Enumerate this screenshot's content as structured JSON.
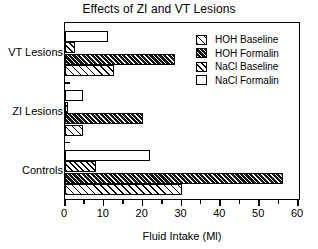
{
  "chart_data": {
    "type": "bar",
    "orientation": "horizontal",
    "title": "Effects of ZI and VT Lesions",
    "xlabel": "Fluid Intake (Ml)",
    "ylabel": "",
    "xlim": [
      0,
      60
    ],
    "xticks": [
      0,
      10,
      20,
      30,
      40,
      50,
      60
    ],
    "xtick_labels": [
      "0",
      "10",
      "20",
      "30",
      "40",
      "50",
      "60"
    ],
    "minor_xticks": [
      5,
      15,
      25,
      35,
      45,
      55
    ],
    "grid": false,
    "legend_position": "top-right",
    "categories": [
      "VT Lesions",
      "ZI Lesions",
      "Controls"
    ],
    "series": [
      {
        "name": "HOH Baseline",
        "pattern": "sparse-diagonal-hatch",
        "values": [
          12.5,
          4.6,
          30.0
        ]
      },
      {
        "name": "HOH Formalin",
        "pattern": "dark-dense-hatch",
        "values": [
          28.2,
          20.1,
          56.2
        ]
      },
      {
        "name": "NaCl Baseline",
        "pattern": "medium-diagonal-hatch",
        "values": [
          2.5,
          0.7,
          8.1
        ]
      },
      {
        "name": "NaCl Formalin",
        "pattern": "white-open",
        "values": [
          11.2,
          4.6,
          21.9
        ]
      }
    ]
  },
  "legend": {
    "items": [
      {
        "label": "HOH Baseline"
      },
      {
        "label": "HOH Formalin"
      },
      {
        "label": "NaCl Baseline"
      },
      {
        "label": "NaCl Formalin"
      }
    ]
  },
  "colors": {
    "axis": "#000000",
    "bar_outline": "#000000",
    "hoh_formalin_fill": "#1a1a1a",
    "background": "#ffffff"
  }
}
